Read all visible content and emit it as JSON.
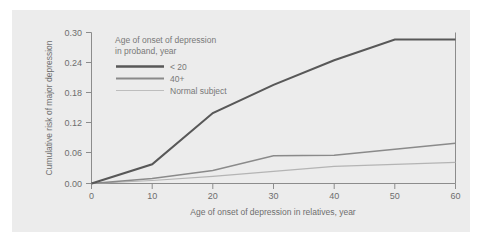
{
  "figure": {
    "background_color": "#ececec",
    "page_color": "#ffffff"
  },
  "chart_data": {
    "type": "line",
    "title": "",
    "xlabel": "Age of onset of depression in relatives, year",
    "ylabel": "Cumulative risk of major depression",
    "xlim": [
      0,
      60
    ],
    "ylim": [
      0.0,
      0.3
    ],
    "xticks": [
      "0",
      "10",
      "20",
      "30",
      "40",
      "50",
      "60"
    ],
    "yticks": [
      "0.00",
      "0.06",
      "0.12",
      "0.18",
      "0.24",
      "0.30"
    ],
    "grid": false,
    "legend_position": "upper-left-inside",
    "legend_title_line1": "Age of onset of depression",
    "legend_title_line2": "in proband, year",
    "x": [
      0,
      10,
      20,
      30,
      40,
      50,
      60
    ],
    "series": [
      {
        "name": "< 20",
        "color": "#585858",
        "values": [
          0.0,
          0.038,
          0.14,
          0.196,
          0.245,
          0.286,
          0.286
        ]
      },
      {
        "name": "40+",
        "color": "#8a8a8a",
        "values": [
          0.0,
          0.01,
          0.026,
          0.055,
          0.056,
          0.068,
          0.08
        ]
      },
      {
        "name": "Normal subject",
        "color": "#b4b4b4",
        "values": [
          0.0,
          0.006,
          0.014,
          0.024,
          0.034,
          0.038,
          0.042
        ]
      }
    ]
  }
}
